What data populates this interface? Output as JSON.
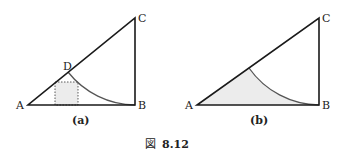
{
  "figure": {
    "caption_prefix": "図",
    "caption_number": "8.12"
  },
  "panel_a": {
    "label": "(a)",
    "points": {
      "A": "A",
      "B": "B",
      "C": "C",
      "D": "D"
    }
  },
  "panel_b": {
    "label": "(b)",
    "points": {
      "A": "A",
      "B": "B",
      "C": "C"
    }
  },
  "colors": {
    "stroke": "#1a1a1a",
    "arc": "#555555",
    "fill": "#e8e8e8"
  }
}
